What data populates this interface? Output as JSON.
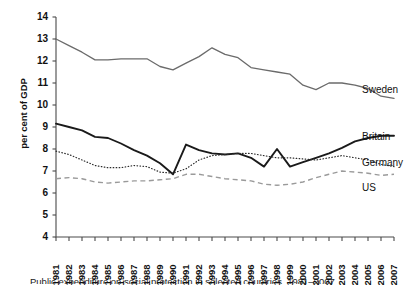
{
  "chart_data": {
    "type": "line",
    "title": "",
    "xlabel": "",
    "ylabel": "per cent of GDP",
    "ylim": [
      4,
      14
    ],
    "yticks": [
      4,
      5,
      6,
      7,
      8,
      9,
      10,
      11,
      12,
      13,
      14
    ],
    "grid": false,
    "legend_position": "right-inline",
    "x": [
      1981,
      1982,
      1983,
      1984,
      1985,
      1986,
      1987,
      1988,
      1989,
      1990,
      1991,
      1992,
      1993,
      1994,
      1995,
      1996,
      1997,
      1998,
      1999,
      2000,
      2001,
      2002,
      2003,
      2004,
      2005,
      2006,
      2007
    ],
    "categories": [
      "1981",
      "1982",
      "1983",
      "1984",
      "1985",
      "1986",
      "1987",
      "1988",
      "1989",
      "1990",
      "1991",
      "1992",
      "1993",
      "1994",
      "1995",
      "1996",
      "1997",
      "1998",
      "1999",
      "2000",
      "2001",
      "2002",
      "2003",
      "2004",
      "2005",
      "2006",
      "2007"
    ],
    "series": [
      {
        "name": "Sweden",
        "style": "solid",
        "color": "#6b6b6b",
        "width": 1.3,
        "values": [
          13.0,
          12.7,
          12.4,
          12.05,
          12.05,
          12.1,
          12.1,
          12.1,
          11.75,
          11.6,
          11.9,
          12.2,
          12.6,
          12.3,
          12.15,
          11.7,
          11.6,
          11.5,
          11.4,
          10.9,
          10.7,
          11.0,
          11.0,
          10.9,
          10.75,
          10.4,
          10.3
        ]
      },
      {
        "name": "Britain",
        "style": "solid",
        "color": "#1a1a1a",
        "width": 1.9,
        "values": [
          9.15,
          9.0,
          8.85,
          8.55,
          8.5,
          8.25,
          7.95,
          7.7,
          7.35,
          6.85,
          8.2,
          7.95,
          7.8,
          7.75,
          7.8,
          7.6,
          7.2,
          8.0,
          7.2,
          7.4,
          7.6,
          7.8,
          8.05,
          8.35,
          8.5,
          8.6,
          8.6
        ]
      },
      {
        "name": "Germany",
        "style": "dotted",
        "color": "#2b2b2b",
        "width": 1.2,
        "values": [
          7.9,
          7.75,
          7.5,
          7.25,
          7.15,
          7.15,
          7.25,
          7.2,
          6.95,
          6.9,
          7.1,
          7.5,
          7.7,
          7.75,
          7.8,
          7.8,
          7.7,
          7.6,
          7.6,
          7.55,
          7.5,
          7.6,
          7.7,
          7.6,
          7.5,
          7.3,
          7.2
        ]
      },
      {
        "name": "US",
        "style": "dashed",
        "color": "#9a9a9a",
        "width": 1.4,
        "values": [
          6.65,
          6.7,
          6.65,
          6.5,
          6.45,
          6.5,
          6.55,
          6.55,
          6.6,
          6.65,
          6.85,
          6.85,
          6.75,
          6.65,
          6.6,
          6.55,
          6.4,
          6.35,
          6.4,
          6.5,
          6.7,
          6.85,
          7.0,
          6.95,
          6.9,
          6.8,
          6.85
        ]
      }
    ],
    "series_labels": [
      {
        "name": "Sweden",
        "x": 362,
        "y": 84
      },
      {
        "name": "Britain",
        "x": 362,
        "y": 131
      },
      {
        "name": "Germany",
        "x": 362,
        "y": 157
      },
      {
        "name": "US",
        "x": 362,
        "y": 182
      }
    ]
  },
  "caption": {
    "text": "Public expenditure on social protection in selected countries, 1981–2007"
  }
}
